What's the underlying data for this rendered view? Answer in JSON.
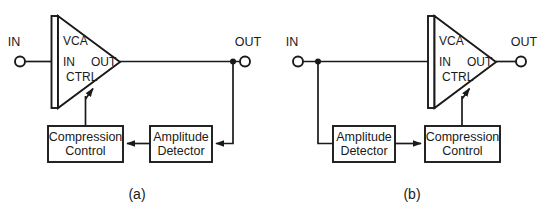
{
  "figure": {
    "width": 550,
    "height": 215,
    "background": "#ffffff",
    "line_color": "#1a1a1a"
  },
  "panels": [
    {
      "id": "a",
      "caption": "(a)",
      "topology": "feedback",
      "terminals": {
        "input": "IN",
        "output": "OUT"
      },
      "vca": {
        "name": "VCA",
        "pins": {
          "input": "IN",
          "output": "OUT",
          "control": "CTRL"
        }
      },
      "blocks": [
        {
          "id": "compression-control",
          "line1": "Compression",
          "line2": "Control"
        },
        {
          "id": "amplitude-detector",
          "line1": "Amplitude",
          "line2": "Detector"
        }
      ],
      "signal_path": [
        "IN -> VCA.IN",
        "VCA.OUT -> OUT",
        "VCA.OUT -> Amplitude Detector",
        "Amplitude Detector -> Compression Control",
        "Compression Control -> VCA.CTRL"
      ]
    },
    {
      "id": "b",
      "caption": "(b)",
      "topology": "feedforward",
      "terminals": {
        "input": "IN",
        "output": "OUT"
      },
      "vca": {
        "name": "VCA",
        "pins": {
          "input": "IN",
          "output": "OUT",
          "control": "CTRL"
        }
      },
      "blocks": [
        {
          "id": "amplitude-detector",
          "line1": "Amplitude",
          "line2": "Detector"
        },
        {
          "id": "compression-control",
          "line1": "Compression",
          "line2": "Control"
        }
      ],
      "signal_path": [
        "IN -> VCA.IN",
        "IN -> Amplitude Detector",
        "Amplitude Detector -> Compression Control",
        "Compression Control -> VCA.CTRL",
        "VCA.OUT -> OUT"
      ]
    }
  ]
}
